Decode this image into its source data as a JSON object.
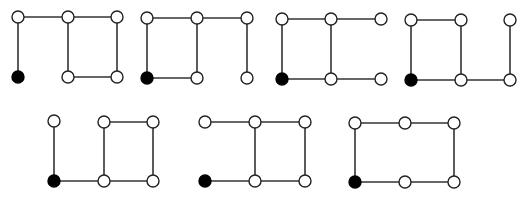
{
  "diagram": {
    "type": "graph-set",
    "node_radius": 6,
    "colors": {
      "edge": "#333333",
      "open_node_fill": "#ffffff",
      "filled_node_fill": "#000000"
    },
    "graphs": [
      {
        "id": "g1",
        "nodes": [
          [
            18,
            17,
            "open"
          ],
          [
            68,
            17,
            "open"
          ],
          [
            117,
            17,
            "open"
          ],
          [
            18,
            77,
            "filled"
          ],
          [
            68,
            77,
            "open"
          ],
          [
            117,
            77,
            "open"
          ]
        ],
        "edges": [
          [
            0,
            1
          ],
          [
            1,
            2
          ],
          [
            0,
            3
          ],
          [
            1,
            4
          ],
          [
            2,
            5
          ],
          [
            4,
            5
          ]
        ]
      },
      {
        "id": "g2",
        "nodes": [
          [
            147,
            18,
            "open"
          ],
          [
            197,
            18,
            "open"
          ],
          [
            247,
            18,
            "open"
          ],
          [
            147,
            78,
            "filled"
          ],
          [
            197,
            78,
            "open"
          ],
          [
            247,
            78,
            "open"
          ]
        ],
        "edges": [
          [
            0,
            1
          ],
          [
            1,
            2
          ],
          [
            0,
            3
          ],
          [
            1,
            4
          ],
          [
            2,
            5
          ],
          [
            3,
            4
          ]
        ]
      },
      {
        "id": "g3",
        "nodes": [
          [
            282,
            19,
            "open"
          ],
          [
            331,
            19,
            "open"
          ],
          [
            381,
            19,
            "open"
          ],
          [
            282,
            79,
            "filled"
          ],
          [
            331,
            79,
            "open"
          ],
          [
            381,
            79,
            "open"
          ]
        ],
        "edges": [
          [
            0,
            1
          ],
          [
            1,
            2
          ],
          [
            0,
            3
          ],
          [
            1,
            4
          ],
          [
            3,
            4
          ],
          [
            4,
            5
          ]
        ]
      },
      {
        "id": "g4",
        "nodes": [
          [
            411,
            20,
            "open"
          ],
          [
            461,
            20,
            "open"
          ],
          [
            510,
            20,
            "open"
          ],
          [
            411,
            80,
            "filled"
          ],
          [
            461,
            80,
            "open"
          ],
          [
            510,
            80,
            "open"
          ]
        ],
        "edges": [
          [
            0,
            1
          ],
          [
            0,
            3
          ],
          [
            1,
            4
          ],
          [
            2,
            5
          ],
          [
            3,
            4
          ],
          [
            4,
            5
          ]
        ]
      },
      {
        "id": "g5",
        "nodes": [
          [
            54,
            121,
            "open"
          ],
          [
            104,
            122,
            "open"
          ],
          [
            153,
            122,
            "open"
          ],
          [
            54,
            181,
            "filled"
          ],
          [
            104,
            181,
            "open"
          ],
          [
            153,
            181,
            "open"
          ]
        ],
        "edges": [
          [
            0,
            3
          ],
          [
            1,
            2
          ],
          [
            1,
            4
          ],
          [
            2,
            5
          ],
          [
            3,
            4
          ],
          [
            4,
            5
          ]
        ]
      },
      {
        "id": "g6",
        "nodes": [
          [
            205,
            122,
            "open"
          ],
          [
            255,
            122,
            "open"
          ],
          [
            305,
            122,
            "open"
          ],
          [
            205,
            181,
            "filled"
          ],
          [
            255,
            181,
            "open"
          ],
          [
            305,
            181,
            "open"
          ]
        ],
        "edges": [
          [
            0,
            1
          ],
          [
            1,
            2
          ],
          [
            1,
            4
          ],
          [
            2,
            5
          ],
          [
            3,
            4
          ],
          [
            4,
            5
          ]
        ]
      },
      {
        "id": "g7",
        "nodes": [
          [
            355,
            123,
            "open"
          ],
          [
            405,
            123,
            "open"
          ],
          [
            454,
            123,
            "open"
          ],
          [
            355,
            182,
            "filled"
          ],
          [
            405,
            182,
            "open"
          ],
          [
            454,
            182,
            "open"
          ]
        ],
        "edges": [
          [
            0,
            1
          ],
          [
            1,
            2
          ],
          [
            0,
            3
          ],
          [
            2,
            5
          ],
          [
            3,
            4
          ],
          [
            4,
            5
          ]
        ]
      }
    ]
  }
}
